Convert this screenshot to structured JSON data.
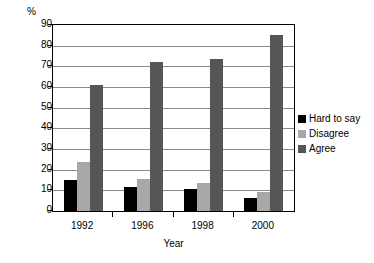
{
  "chart_data": {
    "type": "bar",
    "title": "",
    "subtitle": "",
    "xlabel": "Year",
    "ylabel": "%",
    "categories": [
      "1992",
      "1996",
      "1998",
      "2000"
    ],
    "series": [
      {
        "name": "Hard to say",
        "color": "#000000",
        "values": [
          15,
          11.5,
          10.5,
          6.5
        ]
      },
      {
        "name": "Disagree",
        "color": "#a8a8a8",
        "values": [
          23.5,
          15.5,
          13.5,
          9
        ]
      },
      {
        "name": "Agree",
        "color": "#565656",
        "values": [
          61,
          72,
          73.5,
          85
        ]
      }
    ],
    "ylim": [
      0,
      90
    ],
    "ytick_values": [
      0,
      10,
      20,
      30,
      40,
      50,
      60,
      70,
      80,
      90
    ],
    "ytick_labels": [
      "0",
      "10",
      "20",
      "30",
      "40",
      "50",
      "60",
      "70",
      "80",
      "90"
    ],
    "grid": "horizontal",
    "legend_position": "right"
  }
}
